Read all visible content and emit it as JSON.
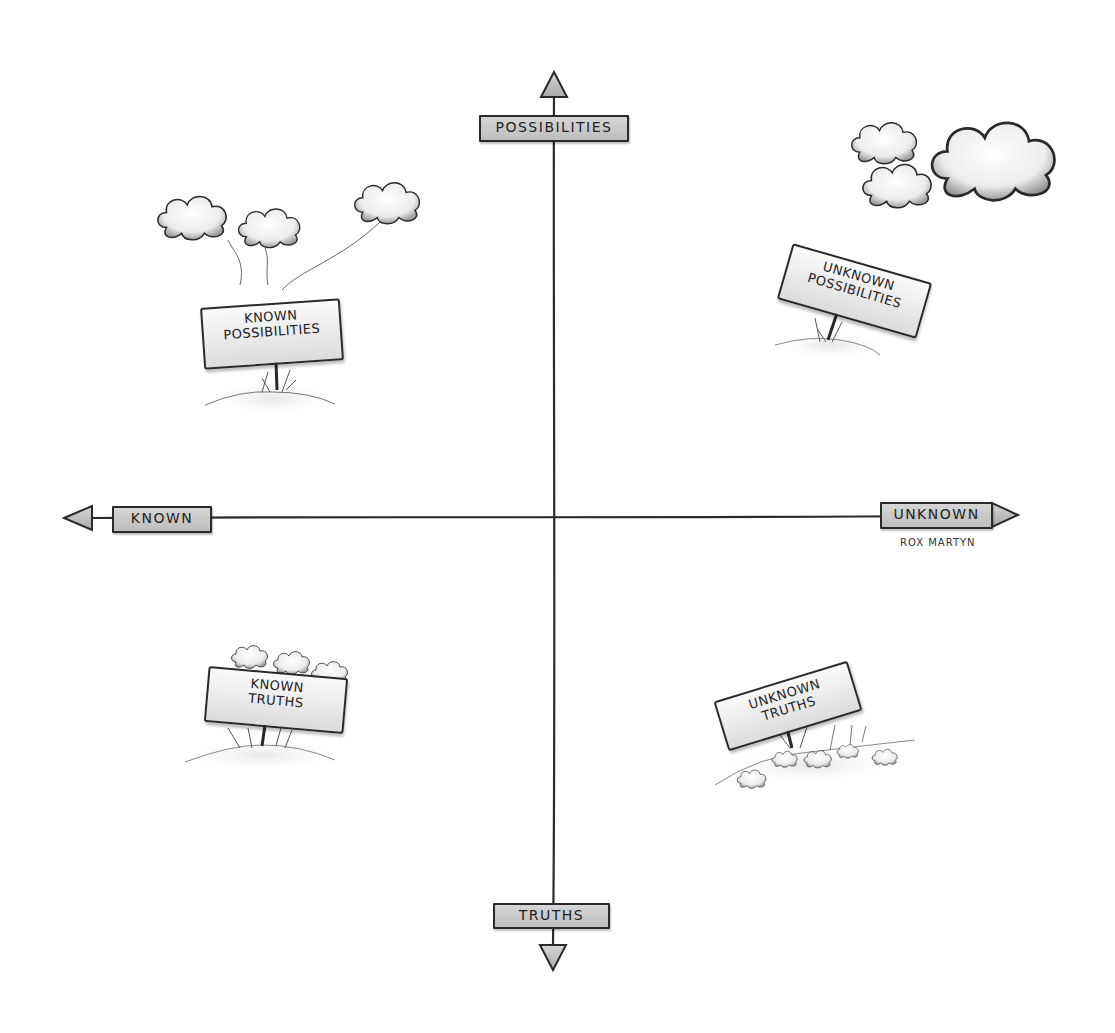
{
  "diagram": {
    "type": "quadrant",
    "axes": {
      "top": "POSSIBILITIES",
      "bottom": "TRUTHS",
      "left": "KNOWN",
      "right": "UNKNOWN"
    },
    "quadrants": {
      "top_left": {
        "line1": "KNOWN",
        "line2": "POSSIBILITIES",
        "decoration": "three cloud balloons tied to sign"
      },
      "top_right": {
        "line1": "UNKNOWN",
        "line2": "POSSIBILITIES",
        "decoration": "floating clouds"
      },
      "bottom_left": {
        "line1": "KNOWN",
        "line2": "TRUTHS",
        "decoration": "small clouds resting on sign"
      },
      "bottom_right": {
        "line1": "UNKNOWN",
        "line2": "TRUTHS",
        "decoration": "small clouds on ground"
      }
    },
    "signature": "ROX MARTYN",
    "colors": {
      "ink": "#2a2a2a",
      "label_fill": "#c8c8c8",
      "sign_fill": "#efefef",
      "background": "#ffffff"
    }
  }
}
